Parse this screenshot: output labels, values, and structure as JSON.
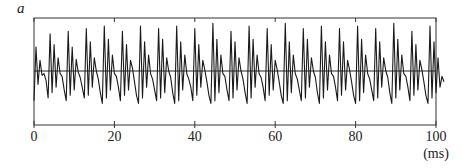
{
  "chart_data": {
    "type": "line",
    "title": "",
    "panel_label": "a",
    "xlabel": "(ms)",
    "ylabel": "",
    "xlim": [
      0,
      100
    ],
    "ylim": [
      -1,
      1
    ],
    "x_ticks": [
      0,
      20,
      40,
      60,
      80,
      100
    ],
    "x_tick_labels": [
      "0",
      "20",
      "40",
      "60",
      "80",
      "100"
    ],
    "grid": false,
    "legend": null,
    "zero_line": true,
    "line_color": "#1a1a1a",
    "sample_interval_ms": 0.5,
    "series": [
      {
        "name": "waveform",
        "x_start": 0,
        "x_step": 0.5,
        "values": [
          -0.55,
          0.45,
          -0.25,
          0.2,
          -0.08,
          -0.05,
          -0.18,
          -0.5,
          0.7,
          -0.4,
          0.5,
          -0.3,
          0.25,
          -0.05,
          -0.1,
          -0.35,
          -0.55,
          0.75,
          -0.45,
          0.45,
          -0.35,
          0.22,
          -0.02,
          -0.12,
          -0.3,
          -0.5,
          0.8,
          -0.45,
          0.55,
          -0.3,
          0.25,
          0.0,
          -0.15,
          -0.4,
          -0.6,
          0.85,
          -0.5,
          0.6,
          -0.35,
          0.3,
          -0.05,
          -0.1,
          -0.3,
          -0.55,
          0.75,
          -0.45,
          0.5,
          -0.35,
          0.2,
          0.05,
          -0.2,
          -0.45,
          -0.6,
          0.85,
          -0.5,
          0.55,
          -0.3,
          0.3,
          -0.05,
          -0.15,
          -0.35,
          -0.55,
          0.8,
          -0.5,
          0.6,
          -0.4,
          0.25,
          0.0,
          -0.12,
          -0.4,
          -0.6,
          0.85,
          -0.55,
          0.55,
          -0.35,
          0.3,
          -0.05,
          -0.15,
          -0.3,
          -0.55,
          0.8,
          -0.45,
          0.5,
          -0.3,
          0.2,
          0.02,
          -0.2,
          -0.45,
          -0.6,
          0.9,
          -0.55,
          0.6,
          -0.4,
          0.3,
          -0.05,
          -0.1,
          -0.35,
          -0.55,
          0.75,
          -0.5,
          0.55,
          -0.35,
          0.25,
          0.0,
          -0.15,
          -0.4,
          -0.6,
          0.85,
          -0.5,
          0.6,
          -0.3,
          0.3,
          -0.05,
          -0.12,
          -0.3,
          -0.55,
          0.8,
          -0.45,
          0.5,
          -0.35,
          0.2,
          0.02,
          -0.2,
          -0.45,
          -0.6,
          0.9,
          -0.55,
          0.55,
          -0.4,
          0.3,
          -0.05,
          -0.15,
          -0.35,
          -0.55,
          0.8,
          -0.5,
          0.6,
          -0.3,
          0.25,
          0.0,
          -0.12,
          -0.4,
          -0.6,
          0.85,
          -0.5,
          0.55,
          -0.35,
          0.3,
          -0.05,
          -0.1,
          -0.3,
          -0.55,
          0.8,
          -0.45,
          0.55,
          -0.35,
          0.2,
          0.02,
          -0.2,
          -0.45,
          -0.6,
          0.85,
          -0.55,
          0.6,
          -0.4,
          0.3,
          -0.05,
          -0.15,
          -0.35,
          -0.55,
          0.8,
          -0.5,
          0.55,
          -0.3,
          0.25,
          0.0,
          -0.12,
          -0.4,
          -0.6,
          0.9,
          -0.5,
          0.6,
          -0.35,
          0.3,
          -0.05,
          -0.1,
          -0.3,
          -0.55,
          0.75,
          -0.45,
          0.5,
          -0.35,
          0.2,
          0.02,
          -0.2,
          -0.45,
          -0.6,
          0.85,
          -0.5,
          0.55,
          -0.4,
          0.25,
          -0.3,
          -0.1,
          -0.2
        ]
      }
    ]
  }
}
